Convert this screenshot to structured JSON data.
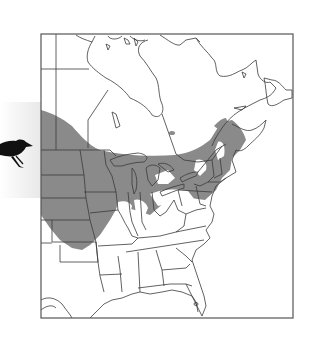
{
  "figure": {
    "type": "range-map",
    "region": "Eastern North America",
    "subject_icon": "blackbird-silhouette",
    "legend": null
  },
  "colors": {
    "background": "#ffffff",
    "range_fill": "#8a8a8a",
    "border_line": "#3a3a3a",
    "frame": "#555555",
    "bird": "#111111"
  },
  "map": {
    "frame": {
      "x": 41,
      "y": 34,
      "width": 252,
      "height": 284
    },
    "shaded_range_description": "Northern Great Plains, Upper Midwest, Great Lakes region, southern Ontario/Quebec, and the northeastern US/Maritimes"
  }
}
